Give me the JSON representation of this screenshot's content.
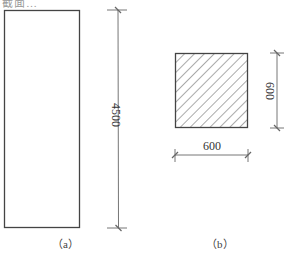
{
  "header_fragment": "截面…",
  "figure_a": {
    "caption": "（a）",
    "dimension_label": "4500"
  },
  "figure_b": {
    "caption": "（b）",
    "width_label": "600",
    "height_label": "600"
  },
  "colors": {
    "line": "#444444",
    "dim_line": "#555555",
    "hatch": "#555555"
  }
}
